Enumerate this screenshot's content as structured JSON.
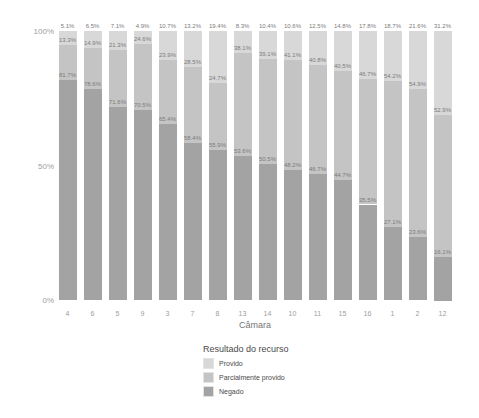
{
  "chart_data": {
    "type": "bar",
    "stacked": true,
    "percent_scale": true,
    "title": "",
    "xlabel": "Câmara",
    "ylabel": "",
    "ylim": [
      0,
      100
    ],
    "grid": false,
    "y_ticks": [
      {
        "label": "100%",
        "value": 100
      },
      {
        "label": "50%",
        "value": 50
      },
      {
        "label": "0%",
        "value": 0
      }
    ],
    "categories": [
      "4",
      "6",
      "5",
      "9",
      "3",
      "7",
      "8",
      "13",
      "14",
      "10",
      "11",
      "15",
      "16",
      "1",
      "2",
      "12"
    ],
    "legend": {
      "title": "Resultado do recurso",
      "position": "bottom",
      "entries": [
        "Provido",
        "Parcialmente provido",
        "Negado"
      ]
    },
    "series": [
      {
        "name": "Provido",
        "color": "#d8d8d8",
        "values": [
          5.1,
          6.5,
          7.1,
          4.9,
          10.7,
          13.2,
          19.4,
          8.3,
          10.4,
          10.6,
          12.5,
          14.8,
          17.8,
          18.7,
          21.6,
          31.2
        ]
      },
      {
        "name": "Parcialmente provido",
        "color": "#c4c4c4",
        "values": [
          13.3,
          14.9,
          21.3,
          24.6,
          23.9,
          28.5,
          24.7,
          38.1,
          39.1,
          41.1,
          40.8,
          40.5,
          46.7,
          54.2,
          54.9,
          52.9
        ]
      },
      {
        "name": "Negado",
        "color": "#a3a3a3",
        "values": [
          81.7,
          78.6,
          71.6,
          70.5,
          65.4,
          58.4,
          55.9,
          53.6,
          50.5,
          48.2,
          46.7,
          44.7,
          35.5,
          27.1,
          23.6,
          16.1
        ]
      }
    ],
    "label_format": "{value}%"
  }
}
